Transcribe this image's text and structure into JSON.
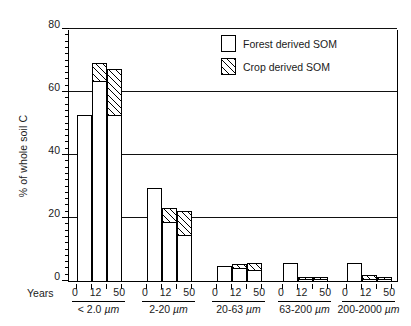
{
  "chart_data": {
    "type": "bar",
    "subtype": "grouped-stacked",
    "title": "",
    "xlabel": "Years",
    "ylabel": "% of whole soil C",
    "ylim": [
      0,
      80
    ],
    "yticks": [
      0,
      20,
      40,
      60,
      80
    ],
    "grid": "horizontal",
    "legend_position": "top-right-inside",
    "legend": [
      {
        "name": "Forest derived SOM",
        "fill": "white"
      },
      {
        "name": "Crop derived SOM",
        "fill": "diagonal-hatch"
      }
    ],
    "series": [
      {
        "name": "Forest derived SOM",
        "values": [
          53,
          64,
          53,
          30,
          19,
          15,
          5,
          4.5,
          4,
          6,
          1,
          1,
          6,
          1,
          1
        ]
      },
      {
        "name": "Crop derived SOM",
        "values": [
          0,
          6,
          15,
          0,
          5,
          8,
          0,
          1.5,
          2.5,
          0,
          1,
          1,
          0,
          1.5,
          1
        ]
      }
    ],
    "groups": [
      {
        "fraction": "< 2.0 µm",
        "bars": [
          {
            "years": "0",
            "forest": 53,
            "crop": 0,
            "total": 53
          },
          {
            "years": "12",
            "forest": 64,
            "crop": 6,
            "total": 70
          },
          {
            "years": "50",
            "forest": 53,
            "crop": 15,
            "total": 68
          }
        ]
      },
      {
        "fraction": "2-20 µm",
        "bars": [
          {
            "years": "0",
            "forest": 30,
            "crop": 0,
            "total": 30
          },
          {
            "years": "12",
            "forest": 19,
            "crop": 5,
            "total": 24
          },
          {
            "years": "50",
            "forest": 15,
            "crop": 8,
            "total": 23
          }
        ]
      },
      {
        "fraction": "20-63 µm",
        "bars": [
          {
            "years": "0",
            "forest": 5,
            "crop": 0,
            "total": 5
          },
          {
            "years": "12",
            "forest": 4.5,
            "crop": 1.5,
            "total": 6
          },
          {
            "years": "50",
            "forest": 4,
            "crop": 2.5,
            "total": 6.5
          }
        ]
      },
      {
        "fraction": "63-200 µm",
        "bars": [
          {
            "years": "0",
            "forest": 6,
            "crop": 0,
            "total": 6
          },
          {
            "years": "12",
            "forest": 1,
            "crop": 1,
            "total": 2
          },
          {
            "years": "50",
            "forest": 1,
            "crop": 1,
            "total": 2
          }
        ]
      },
      {
        "fraction": "200-2000 µm",
        "bars": [
          {
            "years": "0",
            "forest": 6,
            "crop": 0,
            "total": 6
          },
          {
            "years": "12",
            "forest": 1,
            "crop": 1.5,
            "total": 2.5
          },
          {
            "years": "50",
            "forest": 1,
            "crop": 1,
            "total": 2
          }
        ]
      }
    ],
    "year_tick_labels": [
      "0",
      "12",
      "50"
    ]
  },
  "axis": {
    "y_title": "% of whole soil C",
    "x_title": "Years",
    "ytick_labels": [
      "80",
      "60",
      "40",
      "20",
      "0"
    ]
  },
  "legend": {
    "forest_label": "Forest derived SOM",
    "crop_label": "Crop derived SOM"
  },
  "fractions": {
    "f0": "< 2.0 µm",
    "f1": "2-20 µm",
    "f2": "20-63 µm",
    "f3": "63-200 µm",
    "f4": "200-2000 µm"
  },
  "years": {
    "y0": "0",
    "y1": "12",
    "y2": "50"
  },
  "colors": {
    "ink": "#000000",
    "fill": "#ffffff",
    "background": "#ffffff"
  }
}
